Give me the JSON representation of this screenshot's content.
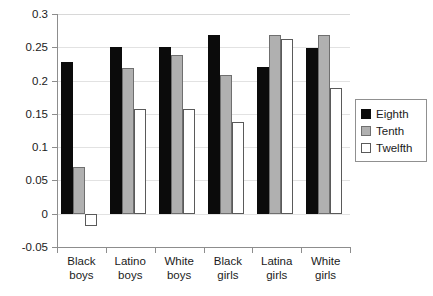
{
  "chart_data": {
    "type": "bar",
    "title": "",
    "subtitle": "",
    "xlabel": "",
    "ylabel": "",
    "ylim": [
      -0.05,
      0.3
    ],
    "ytick_labels": [
      "0.3",
      "0.25",
      "0.2",
      "0.15",
      "0.1",
      "0.05",
      "0",
      "-0.05"
    ],
    "ytick_values": [
      0.3,
      0.25,
      0.2,
      0.15,
      0.1,
      0.05,
      0,
      -0.05
    ],
    "grid": true,
    "grid_axis": "y",
    "legend_position": "right",
    "categories": [
      "Black boys",
      "Latino boys",
      "White boys",
      "Black girls",
      "Latina girls",
      "White girls"
    ],
    "category_lines": [
      [
        "Black",
        "boys"
      ],
      [
        "Latino",
        "boys"
      ],
      [
        "White",
        "boys"
      ],
      [
        "Black",
        "girls"
      ],
      [
        "Latina",
        "girls"
      ],
      [
        "White",
        "girls"
      ]
    ],
    "series": [
      {
        "name": "Eighth",
        "color": "#0b0b0b",
        "values": [
          0.228,
          0.25,
          0.25,
          0.268,
          0.22,
          0.249
        ]
      },
      {
        "name": "Tenth",
        "color": "#b0b0b0",
        "values": [
          0.07,
          0.219,
          0.238,
          0.209,
          0.268,
          0.268
        ]
      },
      {
        "name": "Twelfth",
        "color": "#ffffff",
        "values": [
          -0.019,
          0.158,
          0.158,
          0.138,
          0.262,
          0.189
        ]
      }
    ]
  },
  "legend": {
    "items": [
      {
        "label": "Eighth",
        "swatch": "eighth"
      },
      {
        "label": "Tenth",
        "swatch": "tenth"
      },
      {
        "label": "Twelfth",
        "swatch": "twelfth"
      }
    ]
  }
}
